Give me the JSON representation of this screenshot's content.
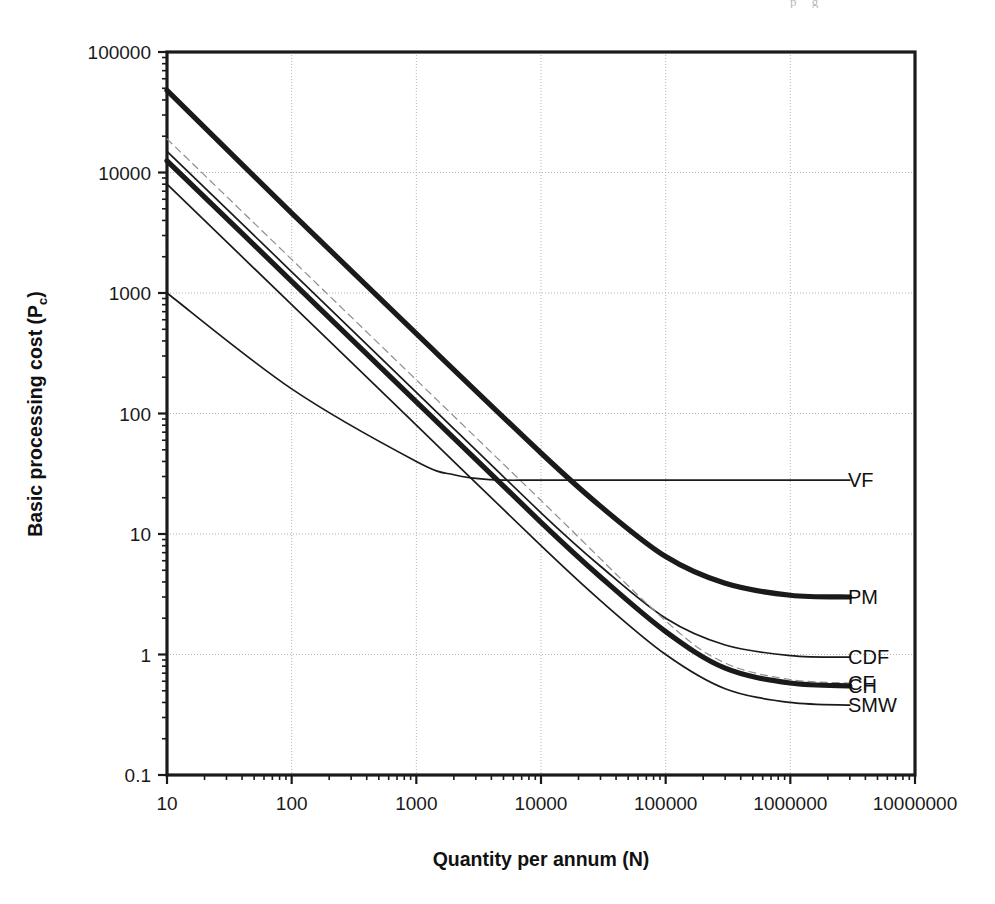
{
  "page": {
    "top_partial_text": "p        g",
    "background_color": "#ffffff",
    "ink_color": "#1a1a1a"
  },
  "chart_data": {
    "type": "line",
    "title": "",
    "xlabel": "Quantity per annum (N)",
    "ylabel": "Basic processing cost (P c)",
    "ylabel_main": "Basic processing cost (P",
    "ylabel_sub": "c",
    "ylabel_close": ")",
    "xscale": "log",
    "yscale": "log",
    "xlim": [
      10,
      10000000
    ],
    "ylim": [
      0.1,
      100000
    ],
    "grid": true,
    "grid_style": "dotted major decades",
    "legend_position": "right-inline-labels",
    "xticks": [
      10,
      100,
      1000,
      10000,
      100000,
      1000000,
      10000000
    ],
    "xtick_labels": [
      "10",
      "100",
      "1000",
      "10000",
      "100000",
      "1000000",
      "10000000"
    ],
    "yticks": [
      0.1,
      1,
      10,
      100,
      1000,
      10000,
      100000
    ],
    "ytick_labels": [
      "0.1",
      "1",
      "10",
      "100",
      "1000",
      "10000",
      "100000"
    ],
    "series": [
      {
        "name": "PM",
        "label": "PM",
        "style": "thick-solid",
        "color": "#1a1a1a",
        "x": [
          10,
          100,
          1000,
          10000,
          30000,
          100000,
          300000,
          1000000,
          3000000
        ],
        "y": [
          48000,
          4600,
          460,
          47,
          17,
          6.5,
          3.9,
          3.1,
          3.0
        ]
      },
      {
        "name": "CDF",
        "label": "CDF",
        "style": "thin-solid",
        "color": "#1a1a1a",
        "x": [
          10,
          100,
          1000,
          10000,
          30000,
          100000,
          300000,
          1000000,
          3000000
        ],
        "y": [
          15000,
          1500,
          150,
          15,
          5.4,
          2.0,
          1.2,
          0.98,
          0.95
        ]
      },
      {
        "name": "CF",
        "label": "CF",
        "style": "faint-dashed",
        "color": "#8e8e8e",
        "x": [
          10,
          100,
          1000,
          10000,
          100000,
          300000,
          1000000,
          3000000
        ],
        "y": [
          19000,
          1900,
          190,
          19,
          1.9,
          0.85,
          0.62,
          0.58
        ]
      },
      {
        "name": "CH",
        "label": "CH",
        "style": "thick-solid",
        "color": "#1a1a1a",
        "x": [
          10,
          100,
          1000,
          10000,
          30000,
          100000,
          300000,
          1000000,
          3000000
        ],
        "y": [
          12500,
          1250,
          125,
          12.5,
          4.4,
          1.55,
          0.77,
          0.58,
          0.55
        ]
      },
      {
        "name": "SMW",
        "label": "SMW",
        "style": "thin-solid",
        "color": "#1a1a1a",
        "x": [
          10,
          100,
          1000,
          10000,
          30000,
          100000,
          300000,
          1000000,
          3000000
        ],
        "y": [
          8000,
          800,
          80,
          8.0,
          2.8,
          1.0,
          0.52,
          0.4,
          0.38
        ]
      },
      {
        "name": "VF",
        "label": "VF",
        "style": "thin-solid",
        "color": "#1a1a1a",
        "x": [
          10,
          100,
          1000,
          2000,
          3000,
          5000,
          10000,
          100000,
          1000000,
          3000000
        ],
        "y": [
          1000,
          160,
          40,
          31,
          29,
          28,
          28,
          28,
          28,
          28
        ]
      }
    ]
  }
}
